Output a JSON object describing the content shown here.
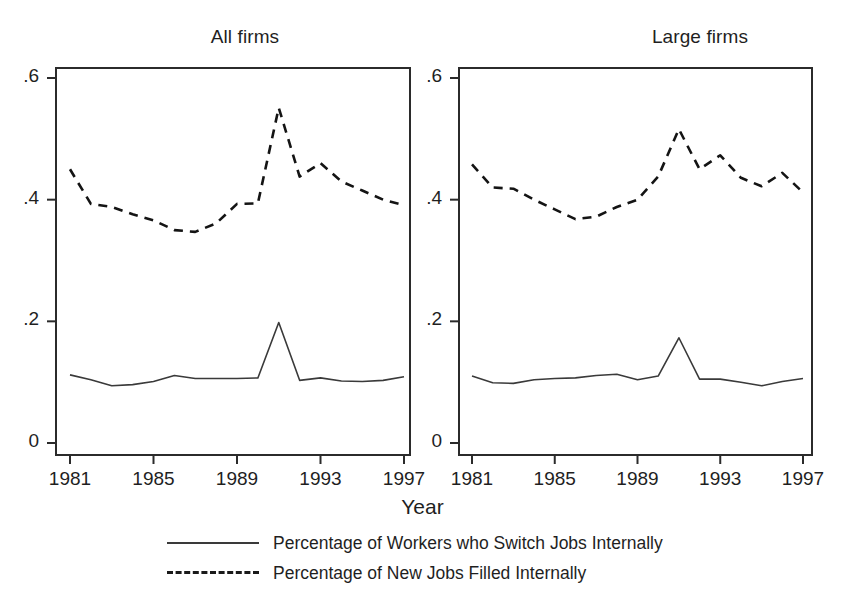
{
  "chart_data": {
    "type": "line",
    "title": "",
    "xlabel": "Year",
    "ylabel": "",
    "xlim": [
      1981,
      1997
    ],
    "ylim": [
      0,
      0.6
    ],
    "yticks": [
      0,
      0.2,
      0.4,
      0.6
    ],
    "ytick_labels": [
      "0",
      ".2",
      ".4",
      ".6"
    ],
    "xticks": [
      1981,
      1985,
      1989,
      1993,
      1997
    ],
    "xtick_labels": [
      "1981",
      "1985",
      "1989",
      "1993",
      "1997"
    ],
    "grid": false,
    "legend_position": "bottom",
    "x": [
      1981,
      1982,
      1983,
      1984,
      1985,
      1986,
      1987,
      1988,
      1989,
      1990,
      1991,
      1992,
      1993,
      1994,
      1995,
      1996,
      1997
    ],
    "panels": [
      {
        "name": "All firms",
        "title": "All firms",
        "series": [
          {
            "name": "Percentage of Workers who Switch Jobs Internally",
            "style": "solid",
            "values": [
              0.112,
              0.104,
              0.094,
              0.096,
              0.101,
              0.111,
              0.106,
              0.106,
              0.106,
              0.107,
              0.198,
              0.103,
              0.107,
              0.102,
              0.101,
              0.103,
              0.109
            ]
          },
          {
            "name": "Percentage of New Jobs Filled Internally",
            "style": "dashed",
            "values": [
              0.45,
              0.393,
              0.388,
              0.376,
              0.366,
              0.35,
              0.347,
              0.361,
              0.393,
              0.394,
              0.551,
              0.438,
              0.46,
              0.43,
              0.415,
              0.4,
              0.391
            ]
          }
        ]
      },
      {
        "name": "Large firms",
        "title": "Large firms",
        "series": [
          {
            "name": "Percentage of Workers who Switch Jobs Internally",
            "style": "solid",
            "values": [
              0.11,
              0.099,
              0.098,
              0.104,
              0.106,
              0.107,
              0.111,
              0.113,
              0.104,
              0.11,
              0.173,
              0.105,
              0.105,
              0.1,
              0.094,
              0.101,
              0.106
            ]
          },
          {
            "name": "Percentage of New Jobs Filled Internally",
            "style": "dashed",
            "values": [
              0.458,
              0.42,
              0.418,
              0.4,
              0.384,
              0.368,
              0.372,
              0.388,
              0.4,
              0.438,
              0.516,
              0.45,
              0.473,
              0.436,
              0.422,
              0.444,
              0.412
            ]
          }
        ]
      }
    ],
    "legend": [
      {
        "label": "Percentage of Workers who Switch Jobs Internally",
        "style": "solid"
      },
      {
        "label": "Percentage of New Jobs Filled Internally",
        "style": "dashed"
      }
    ],
    "colors": {
      "solid": "#3a3a3a",
      "dashed": "#141414",
      "frame": "#2b2b2b",
      "text": "#1f1f1f",
      "background": "#ffffff"
    }
  }
}
